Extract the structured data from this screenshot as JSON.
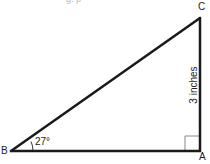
{
  "diagram": {
    "type": "right-triangle",
    "top_fragment": "g. p",
    "vertices": {
      "A": {
        "label": "A",
        "x": 200,
        "y": 151
      },
      "B": {
        "label": "B",
        "x": 11,
        "y": 151
      },
      "C": {
        "label": "C",
        "x": 200,
        "y": 18
      }
    },
    "angle_B": {
      "label": "27°",
      "value_degrees": 27
    },
    "right_angle_at": "A",
    "side_AC": {
      "label": "3 inches",
      "length": 3,
      "unit": "inches"
    },
    "colors": {
      "stroke": "#1a1a1a",
      "right_angle_marker": "#888888",
      "text": "#222222",
      "background": "#ffffff"
    }
  }
}
